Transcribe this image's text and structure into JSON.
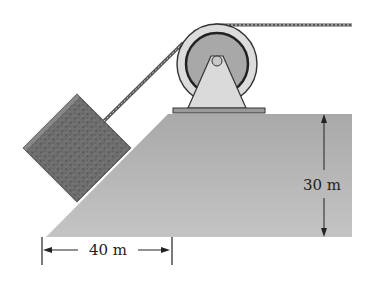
{
  "diagram": {
    "type": "physics-pulley-incline",
    "labels": {
      "height": "30 m",
      "horizontal": "40 m"
    },
    "elements": {
      "block": "textured crate on incline",
      "pulley": "pulley wheel on bracket",
      "rope": "twisted rope",
      "ramp": "inclined platform"
    },
    "colors": {
      "ramp": "#b4b4b4",
      "block": "#6e6e6e",
      "pulley_outer": "#dcdcdc",
      "pulley_inner": "#a8a8a8",
      "bracket": "#d8d8d8",
      "line": "#222222"
    }
  }
}
